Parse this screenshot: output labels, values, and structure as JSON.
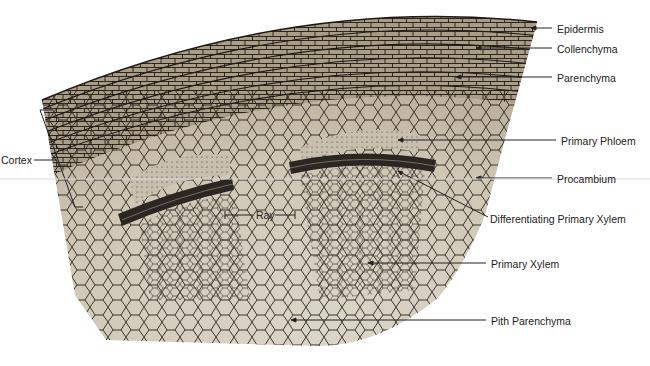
{
  "diagram": {
    "colors": {
      "tissue_fill": "#a99d86",
      "inner_fill": "#d6cfc0",
      "cell_wall": "#1e1a16",
      "cambium_band": "#2a2622",
      "label_text": "#222222",
      "leader_line": "#222222"
    },
    "labels": [
      {
        "id": "epidermis",
        "text": "Epidermis"
      },
      {
        "id": "collenchyma",
        "text": "Collenchyma"
      },
      {
        "id": "parenchyma",
        "text": "Parenchyma"
      },
      {
        "id": "primary-phloem",
        "text": "Primary Phloem"
      },
      {
        "id": "procambium",
        "text": "Procambium"
      },
      {
        "id": "differentiating-primary-xylem",
        "text": "Differentiating Primary Xylem"
      },
      {
        "id": "primary-xylem",
        "text": "Primary Xylem"
      },
      {
        "id": "pith-parenchyma",
        "text": "Pith Parenchyma"
      },
      {
        "id": "ray",
        "text": "Ray"
      },
      {
        "id": "cortex",
        "text": "Cortex"
      }
    ]
  }
}
